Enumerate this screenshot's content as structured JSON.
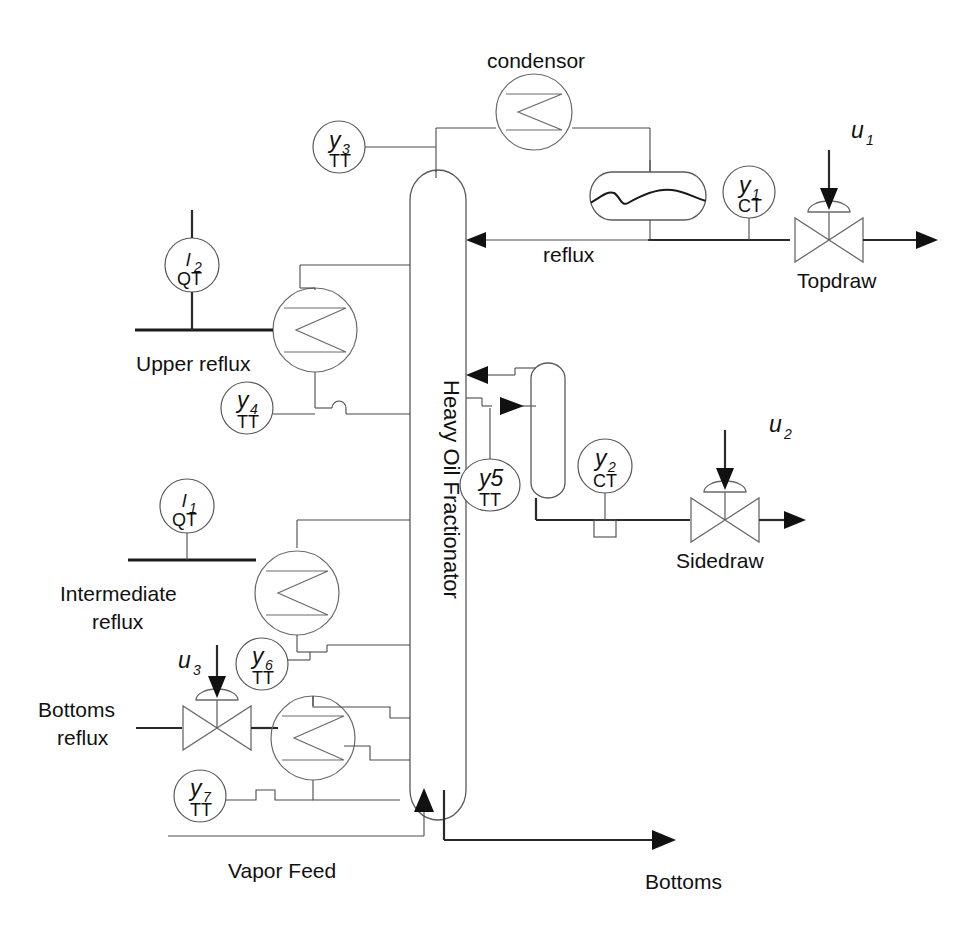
{
  "diagram": {
    "column_label": "Heavy Oil Fractionator",
    "stroke_color": "#4a4a4a",
    "text_color": "#111111",
    "background": "#ffffff"
  },
  "equipment": {
    "condensor_label": "condensor",
    "column": "Heavy Oil Fractionator",
    "reflux_drum": "reflux-drum",
    "sidedraw_drum": "sidedraw-drum"
  },
  "streams": {
    "reflux": "reflux",
    "upper_reflux": "Upper reflux",
    "intermediate_reflux_line1": "Intermediate",
    "intermediate_reflux_line2": "reflux",
    "bottoms_reflux_line1": "Bottoms",
    "bottoms_reflux_line2": "reflux",
    "vapor_feed": "Vapor Feed",
    "bottoms": "Bottoms",
    "topdraw": "Topdraw",
    "sidedraw": "Sidedraw"
  },
  "instruments": [
    {
      "id": "y3-tt",
      "var": "y",
      "sub": "3",
      "type": "TT",
      "shape": "circle"
    },
    {
      "id": "y1-ct",
      "var": "y",
      "sub": "1",
      "type": "CT",
      "shape": "circle"
    },
    {
      "id": "l2-qt",
      "var": "l",
      "sub": "2",
      "type": "QT",
      "shape": "circle"
    },
    {
      "id": "y4-tt",
      "var": "y",
      "sub": "4",
      "type": "TT",
      "shape": "circle"
    },
    {
      "id": "y5-tt",
      "var": "y5",
      "sub": "",
      "type": "TT",
      "shape": "ellipse"
    },
    {
      "id": "y2-ct",
      "var": "y",
      "sub": "2",
      "type": "CT",
      "shape": "circle"
    },
    {
      "id": "l1-qt",
      "var": "l",
      "sub": "1",
      "type": "QT",
      "shape": "circle"
    },
    {
      "id": "y6-tt",
      "var": "y",
      "sub": "6",
      "type": "TT",
      "shape": "circle"
    },
    {
      "id": "y7-tt",
      "var": "y",
      "sub": "7",
      "type": "TT",
      "shape": "circle"
    }
  ],
  "manipulated_variables": [
    {
      "id": "u1",
      "var": "u",
      "sub": "1",
      "valve": "Topdraw"
    },
    {
      "id": "u2",
      "var": "u",
      "sub": "2",
      "valve": "Sidedraw"
    },
    {
      "id": "u3",
      "var": "u",
      "sub": "3",
      "valve": "Bottoms reflux"
    }
  ],
  "tags": {
    "y3_var": "y",
    "y3_sub": "3",
    "y3_type": "TT",
    "y1_var": "y",
    "y1_sub": "1",
    "y1_type": "CT",
    "l2_var": "l",
    "l2_sub": "2",
    "l2_type": "QT",
    "y4_var": "y",
    "y4_sub": "4",
    "y4_type": "TT",
    "y5_var": "y5",
    "y5_type": "TT",
    "y2_var": "y",
    "y2_sub": "2",
    "y2_type": "CT",
    "l1_var": "l",
    "l1_sub": "1",
    "l1_type": "QT",
    "y6_var": "y",
    "y6_sub": "6",
    "y6_type": "TT",
    "y7_var": "y",
    "y7_sub": "7",
    "y7_type": "TT",
    "u1_var": "u",
    "u1_sub": "1",
    "u2_var": "u",
    "u2_sub": "2",
    "u3_var": "u",
    "u3_sub": "3"
  }
}
